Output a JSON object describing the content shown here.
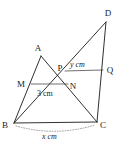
{
  "figure": {
    "background_color": "#ffffff",
    "line_color": "#1a1a1a",
    "dotted_color": "#7a7a7a",
    "points": {
      "A": {
        "label": "A",
        "x": 41,
        "y": 56,
        "label_x": 38,
        "label_y": 51
      },
      "B": {
        "label": "B",
        "x": 14,
        "y": 123,
        "label_x": 3,
        "label_y": 128
      },
      "C": {
        "label": "C",
        "x": 97,
        "y": 122,
        "label_x": 100,
        "label_y": 128
      },
      "D": {
        "label": "D",
        "x": 106,
        "y": 22,
        "label_x": 105,
        "label_y": 16
      },
      "P": {
        "label": "P",
        "x": 65,
        "y": 71,
        "label_x": 58,
        "label_y": 71
      },
      "Q": {
        "label": "Q",
        "x": 103,
        "y": 70,
        "label_x": 105,
        "label_y": 73
      },
      "M": {
        "label": "M",
        "x": 31,
        "y": 84,
        "label_x": 19,
        "label_y": 86
      },
      "N": {
        "label": "N",
        "x": 68,
        "y": 84,
        "label_x": 70,
        "label_y": 89
      }
    },
    "segments": [
      {
        "name": "segment-BC",
        "from": "B",
        "to": "C"
      },
      {
        "name": "segment-BA",
        "from": "B",
        "to": "A"
      },
      {
        "name": "segment-AC",
        "from": "A",
        "to": "C"
      },
      {
        "name": "segment-BD",
        "from": "B",
        "to": "D"
      },
      {
        "name": "segment-DC",
        "from": "D",
        "to": "C"
      },
      {
        "name": "segment-MN",
        "from": "M",
        "to": "N"
      },
      {
        "name": "segment-PQ",
        "from": "P",
        "to": "Q"
      }
    ],
    "measurements": {
      "pq": {
        "value": "y cm",
        "italic_part": "y",
        "unit_part": " cm",
        "x": 71,
        "y": 66
      },
      "mn": {
        "value": "3 cm",
        "x": 40,
        "y": 95
      },
      "bc": {
        "value": "x cm",
        "italic_part": "x",
        "unit_part": " cm",
        "x": 42,
        "y": 139
      }
    },
    "arc": {
      "name": "bc-dimension-arc",
      "start_x": 16,
      "start_y": 126,
      "end_x": 95,
      "end_y": 125,
      "sag": 8
    }
  }
}
